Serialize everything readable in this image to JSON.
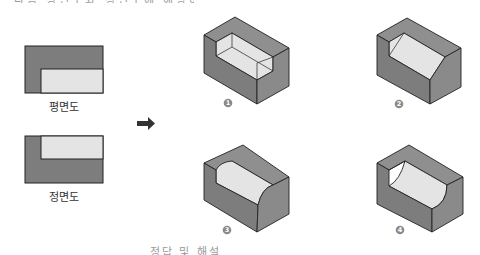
{
  "question": {
    "stem_clipped": "다음 평면도와 정면도에 해당하는 입체도는?",
    "footer_clipped": "정답 및 해설"
  },
  "views": {
    "plan": {
      "label": "평면도"
    },
    "front": {
      "label": "정면도"
    }
  },
  "arrow": {
    "icon": "right-arrow-icon"
  },
  "choices": [
    {
      "number": "1",
      "variant": "rectangular-notch"
    },
    {
      "number": "2",
      "variant": "chamfered-notch"
    },
    {
      "number": "3",
      "variant": "convex-rounded-notch"
    },
    {
      "number": "4",
      "variant": "concave-curved-notch"
    }
  ],
  "colors": {
    "dark_face": "#7d7d7d",
    "mid_face": "#8f8f8f",
    "light_face": "#e4e4e4",
    "outline": "#222222",
    "badge": "#8a8a8a"
  }
}
